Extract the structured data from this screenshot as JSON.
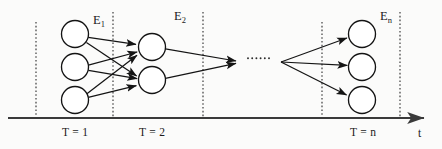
{
  "figure": {
    "background_color": "#fbfbfa",
    "ink_color": "#141414",
    "axis_color": "#3a3a3a"
  },
  "axis": {
    "name": "t",
    "name_x": 418,
    "name_y": 131,
    "baseline_y": 118,
    "baseline_x_start": 8,
    "baseline_x_end": 427,
    "arrow": "right"
  },
  "dividers": [
    {
      "id": "divider-0",
      "x": 36,
      "y_top": 22,
      "y_bottom": 118
    },
    {
      "id": "divider-1",
      "x": 113,
      "y_top": 12,
      "y_bottom": 118
    },
    {
      "id": "divider-2",
      "x": 203,
      "y_top": 12,
      "y_bottom": 118
    },
    {
      "id": "divider-3",
      "x": 322,
      "y_top": 22,
      "y_bottom": 118
    },
    {
      "id": "divider-4",
      "x": 400,
      "y_top": 12,
      "y_bottom": 118
    }
  ],
  "epoch_labels": [
    {
      "id": "epoch-1",
      "base": "E",
      "sub": "1",
      "x": 93,
      "y": 14
    },
    {
      "id": "epoch-2",
      "base": "E",
      "sub": "2",
      "x": 174,
      "y": 10
    },
    {
      "id": "epoch-n",
      "base": "E",
      "sub": "n",
      "x": 380,
      "y": 10
    }
  ],
  "time_labels": [
    {
      "id": "time-1",
      "text": "T = 1",
      "x": 62,
      "y": 127
    },
    {
      "id": "time-2",
      "text": "T = 2",
      "x": 139,
      "y": 127
    },
    {
      "id": "time-n",
      "text": "T = n",
      "x": 350,
      "y": 127
    }
  ],
  "layers": [
    {
      "id": "layer-t1",
      "time": "T = 1",
      "node_count": 3,
      "cx": 75,
      "r": 13.5,
      "cys": [
        34,
        67,
        100
      ]
    },
    {
      "id": "layer-t2",
      "time": "T = 2",
      "node_count": 2,
      "cx": 152,
      "r": 13.5,
      "cys": [
        47,
        80
      ]
    },
    {
      "id": "layer-tn",
      "time": "T = n",
      "node_count": 3,
      "cx": 362,
      "r": 13.5,
      "cys": [
        34,
        67,
        100
      ]
    }
  ],
  "ellipsis": {
    "id": "ellipsis-dots",
    "text": "......",
    "x": 248,
    "y": 58,
    "dot_count": 6,
    "dot_spacing": 4.2,
    "dot_radius": 0.9
  },
  "convergence_point": {
    "x": 237,
    "y": 62
  },
  "fanout_point": {
    "x": 281,
    "y": 62
  },
  "edges": {
    "layer1_to_layer2": "full bipartite 3x2",
    "layer2_to_converge": "2 edges merging to single arrowhead",
    "fanout_to_layern": "1 point to 3 nodes"
  }
}
